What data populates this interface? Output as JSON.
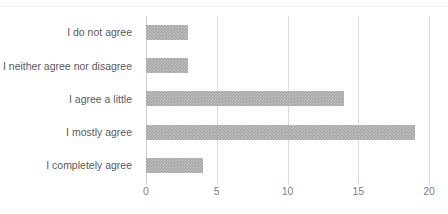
{
  "chart_data": {
    "type": "bar",
    "orientation": "horizontal",
    "title": "",
    "subtitle": "",
    "xlabel": "",
    "ylabel": "",
    "categories": [
      "I do not agree",
      "I neither agree nor disagree",
      "I agree a little",
      "I mostly agree",
      "I completely agree"
    ],
    "values": [
      3,
      3,
      14,
      19,
      4
    ],
    "series": [
      {
        "name": "",
        "values": [
          3,
          3,
          14,
          19,
          4
        ]
      }
    ],
    "xlim": [
      0,
      20
    ],
    "xticks": [
      0,
      5,
      10,
      15,
      20
    ],
    "xtick_labels": [
      "0",
      "5",
      "10",
      "15",
      "20"
    ],
    "grid": "vertical",
    "legend": "none",
    "bar_color": "#a6a6a6",
    "gridline_color": "#d9d9d9",
    "category_label_color": "#595959",
    "value_label_color": "#7f7f7f",
    "background_color": "#ffffff"
  }
}
